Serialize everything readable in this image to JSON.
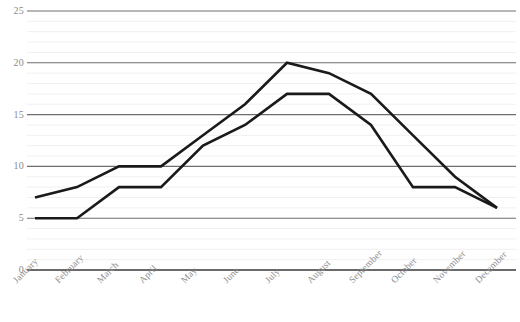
{
  "chart_data": {
    "type": "line",
    "title": "",
    "subtitle": "",
    "xlabel": "",
    "ylabel": "",
    "categories": [
      "January",
      "February",
      "March",
      "April",
      "May",
      "June",
      "July",
      "August",
      "September",
      "October",
      "November",
      "December"
    ],
    "series": [
      {
        "name": "Series 1",
        "color": "#1a1a1a",
        "values": [
          7,
          8,
          10,
          10,
          13,
          16,
          20,
          19,
          17,
          13,
          9,
          6
        ]
      },
      {
        "name": "Series 2",
        "color": "#1a1a1a",
        "values": [
          5,
          5,
          8,
          8,
          12,
          14,
          17,
          17,
          14,
          8,
          8,
          6
        ]
      }
    ],
    "ylim": [
      0,
      25
    ],
    "yticks": [
      0,
      5,
      10,
      15,
      20,
      25
    ],
    "ytick_labels": [
      "0",
      "5",
      "10",
      "15",
      "20",
      "25"
    ],
    "minor_ytick_step": 1,
    "grid": true,
    "grid_axis": "y",
    "legend": false,
    "legend_position": "none",
    "markers": false,
    "line_width": 2.6,
    "colors": {
      "line": "#1a1a1a",
      "major_grid": "#6e6e6e",
      "minor_grid": "#f0f0f0",
      "axis": "#3a3a3a",
      "tick_text": "#8a8a8a",
      "background": "#ffffff"
    }
  },
  "axes": {
    "y_tick_labels": [
      "25",
      "20",
      "15",
      "10",
      "5",
      "0"
    ],
    "x_tick_labels": [
      "January",
      "February",
      "March",
      "April",
      "May",
      "June",
      "July",
      "August",
      "September",
      "October",
      "November",
      "December"
    ]
  }
}
